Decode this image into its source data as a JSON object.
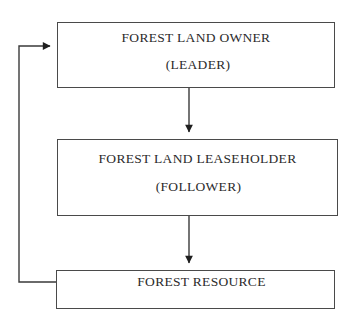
{
  "diagram": {
    "background_color": "#ffffff",
    "stroke_color": "#4a4a4a",
    "text_color": "#2b2b2b",
    "nodes": [
      {
        "id": "owner",
        "primary": "FOREST LAND OWNER",
        "secondary": "(LEADER)"
      },
      {
        "id": "leaseholder",
        "primary": "FOREST LAND LEASEHOLDER",
        "secondary": "(FOLLOWER)"
      },
      {
        "id": "resource",
        "primary": "FOREST RESOURCE",
        "secondary": ""
      }
    ],
    "connectors": [
      {
        "id": "owner-to-leaseholder",
        "from": "owner",
        "to": "leaseholder",
        "direction": "down",
        "arrowhead": true,
        "label": ""
      },
      {
        "id": "leaseholder-to-resource",
        "from": "leaseholder",
        "to": "resource",
        "direction": "down",
        "arrowhead": true,
        "label": ""
      },
      {
        "id": "resource-to-owner-feedback",
        "from": "resource",
        "to": "owner",
        "direction": "left-up-right",
        "arrowhead": true,
        "label": ""
      }
    ]
  }
}
